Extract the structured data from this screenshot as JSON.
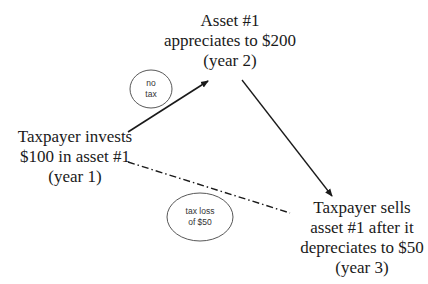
{
  "diagram": {
    "nodes": {
      "top": {
        "lines": [
          "Asset #1",
          "appreciates to $200",
          "(year 2)"
        ]
      },
      "left": {
        "lines": [
          "Taxpayer invests",
          "$100 in asset #1",
          "(year 1)"
        ]
      },
      "right": {
        "lines": [
          "Taxpayer sells",
          "asset #1 after it",
          "depreciates to $50",
          "(year 3)"
        ]
      }
    },
    "annotations": {
      "no_tax": {
        "lines": [
          "no",
          "tax"
        ]
      },
      "tax_loss": {
        "lines": [
          "tax loss",
          "of $50"
        ]
      }
    },
    "edges": [
      {
        "from": "left",
        "to": "top",
        "style": "solid-arrow",
        "label": "no tax"
      },
      {
        "from": "top",
        "to": "right",
        "style": "solid-arrow"
      },
      {
        "from": "left",
        "to": "right",
        "style": "dash-dot",
        "label": "tax loss of $50"
      }
    ],
    "colors": {
      "line": "#1a1a1a",
      "text": "#1a1a1a",
      "background": "#ffffff"
    }
  }
}
